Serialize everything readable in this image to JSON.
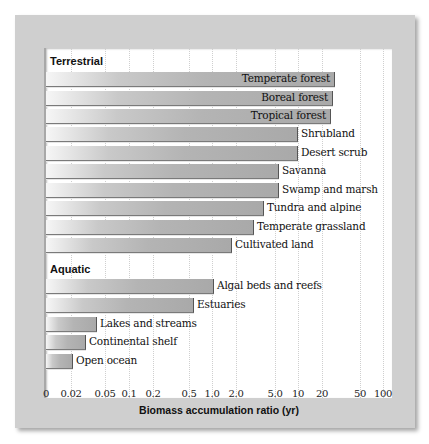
{
  "chart_data": {
    "type": "bar",
    "orientation": "horizontal",
    "title": "",
    "xlabel": "Biomass accumulation ratio (yr)",
    "ylabel": "",
    "xscale": "log (with 0 at origin)",
    "xlim": [
      0,
      100
    ],
    "xticks": [
      "0",
      "0.02",
      "0.05",
      "0.1",
      "0.2",
      "0.5",
      "1.0",
      "2.0",
      "5.0",
      "10",
      "20",
      "50",
      "100"
    ],
    "grid": "vertical dotted",
    "legend": "none",
    "groups": [
      {
        "name": "Terrestrial",
        "categories": [
          "Temperate forest",
          "Boreal forest",
          "Tropical forest",
          "Shrubland",
          "Desert scrub",
          "Savanna",
          "Swamp and marsh",
          "Tundra and alpine",
          "Temperate grassland",
          "Cultivated land"
        ],
        "values": [
          25,
          24,
          23,
          10,
          10,
          5,
          5,
          3.5,
          2.7,
          1.7
        ]
      },
      {
        "name": "Aquatic",
        "categories": [
          "Algal beds and reefs",
          "Estuaries",
          "Lakes and streams",
          "Continental shelf",
          "Open ocean"
        ],
        "values": [
          1.0,
          0.6,
          0.04,
          0.03,
          0.02
        ]
      }
    ]
  },
  "groups": {
    "terrestrial": "Terrestrial",
    "aquatic": "Aquatic"
  },
  "bars": [
    {
      "label": "Temperate forest",
      "end_px": 288,
      "top": 24,
      "inside": true
    },
    {
      "label": "Boreal forest",
      "end_px": 286,
      "top": 43,
      "inside": true
    },
    {
      "label": "Tropical forest",
      "end_px": 284,
      "top": 61,
      "inside": true
    },
    {
      "label": "Shrubland",
      "end_px": 251,
      "top": 79,
      "inside": false
    },
    {
      "label": "Desert scrub",
      "end_px": 251,
      "top": 98,
      "inside": false
    },
    {
      "label": "Savanna",
      "end_px": 232,
      "top": 116,
      "inside": false
    },
    {
      "label": "Swamp and marsh",
      "end_px": 232,
      "top": 135,
      "inside": false
    },
    {
      "label": "Tundra and alpine",
      "end_px": 217,
      "top": 153,
      "inside": false
    },
    {
      "label": "Temperate grassland",
      "end_px": 207,
      "top": 172,
      "inside": false
    },
    {
      "label": "Cultivated land",
      "end_px": 185,
      "top": 190,
      "inside": false
    },
    {
      "label": "Algal beds and reefs",
      "end_px": 167,
      "top": 231,
      "inside": false
    },
    {
      "label": "Estuaries",
      "end_px": 147,
      "top": 250,
      "inside": false
    },
    {
      "label": "Lakes and streams",
      "end_px": 50,
      "top": 269,
      "inside": false
    },
    {
      "label": "Continental shelf",
      "end_px": 39,
      "top": 287,
      "inside": false
    },
    {
      "label": "Open ocean",
      "end_px": 26,
      "top": 306,
      "inside": false
    }
  ],
  "ticks": [
    {
      "label": "0",
      "x": 46
    },
    {
      "label": "0.02",
      "x": 71
    },
    {
      "label": "0.05",
      "x": 105
    },
    {
      "label": "0.1",
      "x": 129
    },
    {
      "label": "0.2",
      "x": 153
    },
    {
      "label": "0.5",
      "x": 189
    },
    {
      "label": "1.0",
      "x": 212
    },
    {
      "label": "2.0",
      "x": 236
    },
    {
      "label": "5.0",
      "x": 275
    },
    {
      "label": "10",
      "x": 298
    },
    {
      "label": "20",
      "x": 322
    },
    {
      "label": "50",
      "x": 360
    },
    {
      "label": "100",
      "x": 383
    }
  ],
  "colors": {
    "frame": "#cfcfcf",
    "plot_bg": "#ffffff",
    "bar_light": "#f6f6f6",
    "bar_dark": "#a9a9a9",
    "text": "#111111"
  }
}
